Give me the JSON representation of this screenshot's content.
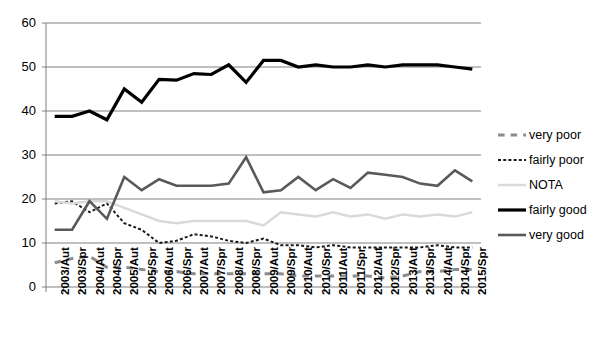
{
  "chart_data": {
    "type": "line",
    "title": "",
    "xlabel": "",
    "ylabel": "",
    "ylim": [
      0,
      60
    ],
    "ytick_values": [
      0,
      10,
      20,
      30,
      40,
      50,
      60
    ],
    "grid": "horizontal",
    "legend_position": "right",
    "categories": [
      "2003/Aut",
      "2003/Spr",
      "2004/Aut",
      "2004/Spr",
      "2005/Aut",
      "2005/Spr",
      "2006/Aut",
      "2006/Spr",
      "2007/Aut",
      "2007/Spr",
      "2008/Aut",
      "2008/Spr",
      "2009/Aut",
      "2009/Spr",
      "2010/Aut",
      "2010/Spr",
      "2011/Aut",
      "2011/Spr",
      "2012/Aut",
      "2012/Spr",
      "2013/Aut",
      "2013/Spr",
      "2014/Aut",
      "2014/Spr",
      "2015/Spr"
    ],
    "series": [
      {
        "name": "very poor",
        "color": "#8c8c8c",
        "style": "dashed",
        "width": 3,
        "values": [
          5.5,
          6.5,
          7.0,
          4.5,
          4.5,
          4.0,
          3.5,
          3.5,
          3.0,
          3.0,
          3.0,
          3.0,
          3.0,
          3.0,
          2.5,
          2.5,
          2.5,
          2.5,
          2.5,
          2.0,
          2.5,
          3.5,
          3.5,
          4.0,
          4.0
        ]
      },
      {
        "name": "fairly poor",
        "color": "#1a1a1a",
        "style": "dotted",
        "width": 2,
        "values": [
          19.0,
          19.5,
          17.0,
          19.0,
          14.5,
          13.0,
          10.0,
          10.5,
          12.0,
          11.5,
          10.5,
          10.0,
          11.0,
          9.5,
          9.5,
          9.0,
          9.5,
          9.0,
          9.0,
          9.0,
          9.0,
          9.0,
          9.5,
          9.0,
          9.0
        ]
      },
      {
        "name": "NOTA",
        "color": "#d9d9d9",
        "style": "solid",
        "width": 2.5,
        "values": [
          19.5,
          19.0,
          19.5,
          19.5,
          18.0,
          16.5,
          15.0,
          14.5,
          15.0,
          15.0,
          15.0,
          15.0,
          14.0,
          17.0,
          16.5,
          16.0,
          17.0,
          16.0,
          16.5,
          15.5,
          16.5,
          16.0,
          16.5,
          16.0,
          17.0
        ]
      },
      {
        "name": "fairly good",
        "color": "#000000",
        "style": "solid",
        "width": 3.2,
        "values": [
          38.8,
          38.8,
          40.0,
          38.0,
          45.0,
          42.0,
          47.2,
          47.0,
          48.5,
          48.3,
          50.5,
          46.5,
          51.5,
          51.5,
          50.0,
          50.5,
          50.0,
          50.0,
          50.5,
          50.0,
          50.5,
          50.5,
          50.5,
          50.0,
          49.5
        ]
      },
      {
        "name": "very good",
        "color": "#595959",
        "style": "solid",
        "width": 2.6,
        "values": [
          13.0,
          13.0,
          19.5,
          15.5,
          25.0,
          22.0,
          24.5,
          23.0,
          23.0,
          23.0,
          23.5,
          29.5,
          21.5,
          22.0,
          25.0,
          22.0,
          24.5,
          22.5,
          26.0,
          25.5,
          25.0,
          23.5,
          23.0,
          26.5,
          24.0
        ]
      }
    ]
  },
  "legend": {
    "items": [
      {
        "label": "very poor"
      },
      {
        "label": "fairly poor"
      },
      {
        "label": "NOTA"
      },
      {
        "label": "fairly good"
      },
      {
        "label": "very good"
      }
    ]
  }
}
